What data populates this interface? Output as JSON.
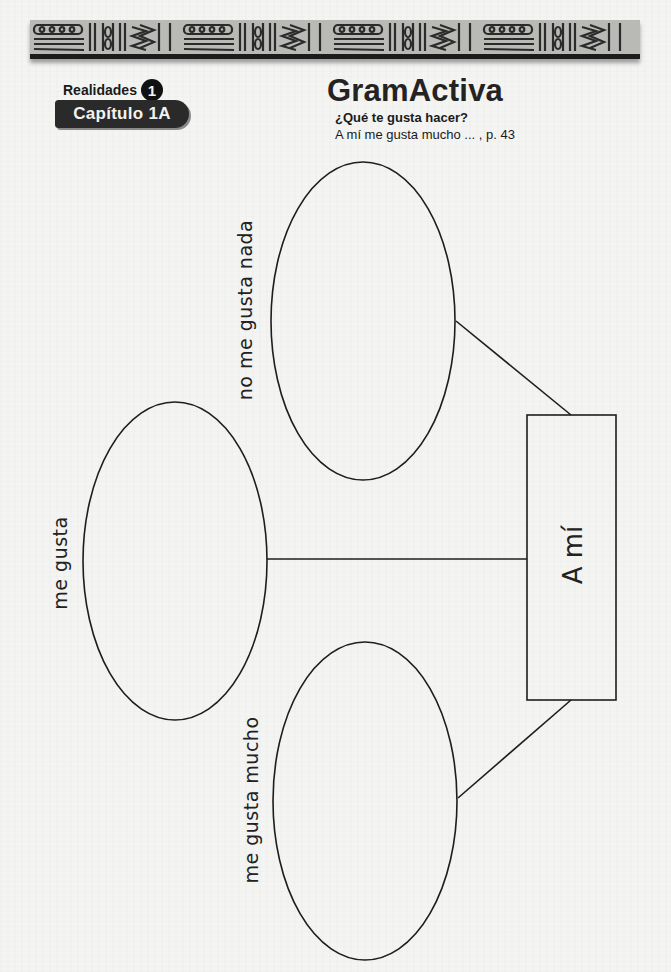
{
  "header": {
    "series": "Realidades",
    "level": "1",
    "chapter": "Capítulo 1A",
    "title": "GramActiva",
    "subtitle": "¿Qué te gusta hacer?",
    "reference": "A mí me gusta mucho ... ,  p. 43"
  },
  "diagram": {
    "center_box": {
      "label": "A mí"
    },
    "ovals": [
      {
        "id": "top",
        "label": "no me gusta nada"
      },
      {
        "id": "left",
        "label": "me gusta"
      },
      {
        "id": "bottom",
        "label": "me gusta mucho"
      }
    ]
  },
  "colors": {
    "paper": "#f4f4f3",
    "ink": "#1a1a1a",
    "banner": "#b9b9b6",
    "pill": "#2a2a2a"
  }
}
